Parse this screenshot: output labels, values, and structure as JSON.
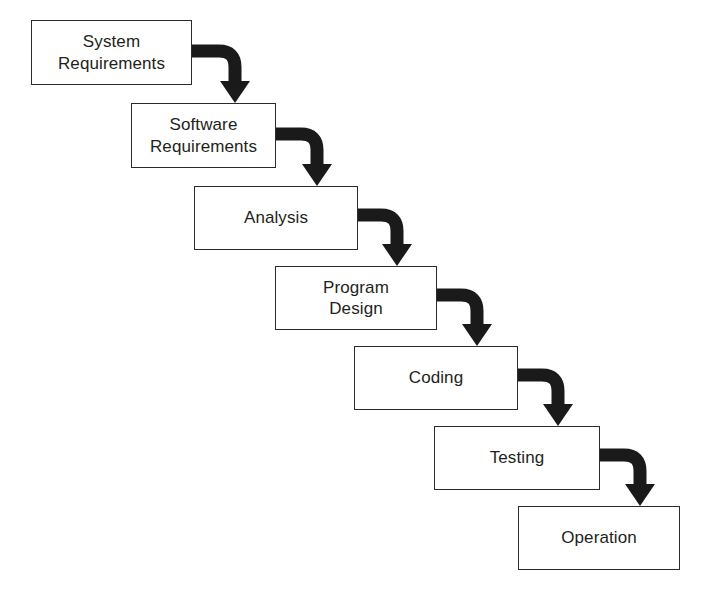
{
  "diagram": {
    "type": "flowchart-waterfall",
    "background_color": "#ffffff",
    "box_border_color": "#2b2b2b",
    "box_fill_color": "#ffffff",
    "text_color": "#231f20",
    "arrow_color": "#1a1a1a",
    "stages": [
      {
        "id": "system-requirements",
        "label": "System\nRequirements",
        "order": 1,
        "x": 31,
        "y": 20,
        "width": 161,
        "height": 65
      },
      {
        "id": "software-requirements",
        "label": "Software\nRequirements",
        "order": 2,
        "x": 131,
        "y": 103,
        "width": 145,
        "height": 65
      },
      {
        "id": "analysis",
        "label": "Analysis",
        "order": 3,
        "x": 194,
        "y": 186,
        "width": 164,
        "height": 64
      },
      {
        "id": "program-design",
        "label": "Program\nDesign",
        "order": 4,
        "x": 275,
        "y": 266,
        "width": 162,
        "height": 64
      },
      {
        "id": "coding",
        "label": "Coding",
        "order": 5,
        "x": 354,
        "y": 346,
        "width": 164,
        "height": 64
      },
      {
        "id": "testing",
        "label": "Testing",
        "order": 6,
        "x": 434,
        "y": 426,
        "width": 166,
        "height": 64
      },
      {
        "id": "operation",
        "label": "Operation",
        "order": 7,
        "x": 518,
        "y": 506,
        "width": 162,
        "height": 64
      }
    ],
    "connectors": [
      {
        "id": "system-to-software",
        "from": "system-requirements",
        "to": "software-requirements",
        "start_x": 192,
        "start_y": 51,
        "turn_x": 235,
        "end_y": 103
      },
      {
        "id": "software-to-analysis",
        "from": "software-requirements",
        "to": "analysis",
        "start_x": 276,
        "start_y": 134,
        "turn_x": 317,
        "end_y": 186
      },
      {
        "id": "analysis-to-program-design",
        "from": "analysis",
        "to": "program-design",
        "start_x": 358,
        "start_y": 215,
        "turn_x": 397,
        "end_y": 266
      },
      {
        "id": "program-design-to-coding",
        "from": "program-design",
        "to": "coding",
        "start_x": 437,
        "start_y": 295,
        "turn_x": 477,
        "end_y": 346
      },
      {
        "id": "coding-to-testing",
        "from": "coding",
        "to": "testing",
        "start_x": 518,
        "start_y": 375,
        "turn_x": 558,
        "end_y": 426
      },
      {
        "id": "testing-to-operation",
        "from": "testing",
        "to": "operation",
        "start_x": 600,
        "start_y": 455,
        "turn_x": 640,
        "end_y": 506
      }
    ]
  }
}
